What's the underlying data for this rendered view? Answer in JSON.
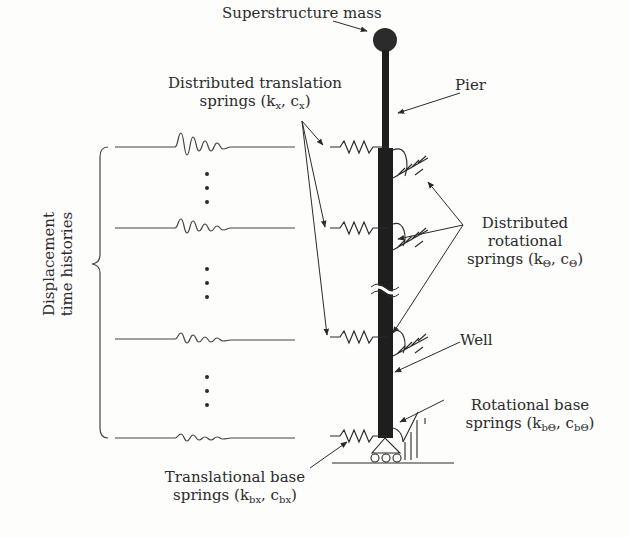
{
  "diagram": {
    "type": "structural model schematic",
    "labels": {
      "superstructure_mass": "Superstructure mass",
      "pier": "Pier",
      "distributed_translation_line1": "Distributed translation",
      "distributed_translation_line2_prefix": "springs (k",
      "distributed_translation_sub_k": "x",
      "distributed_translation_mid": ", c",
      "distributed_translation_sub_c": "x",
      "distributed_translation_suffix": ")",
      "distributed_rotational_line1": "Distributed",
      "distributed_rotational_line2": "rotational",
      "distributed_rotational_line3_prefix": "springs (k",
      "distributed_rotational_sub_k": "Θ",
      "distributed_rotational_mid": ", c",
      "distributed_rotational_sub_c": "Θ",
      "distributed_rotational_suffix": ")",
      "well": "Well",
      "rotational_base_line1": "Rotational base",
      "rotational_base_line2_prefix": "springs (k",
      "rotational_base_sub_k": "bΘ",
      "rotational_base_mid": ", c",
      "rotational_base_sub_c": "bΘ",
      "rotational_base_suffix": ")",
      "translational_base_line1": "Translational base",
      "translational_base_line2_prefix": "springs (k",
      "translational_base_sub_k": "bx",
      "translational_base_mid": ", c",
      "translational_base_sub_c": "bx",
      "translational_base_suffix": ")",
      "displacement_line1": "Displacement",
      "displacement_line2": "time histories"
    },
    "time_history_rows_y": [
      147,
      228,
      337,
      436
    ],
    "spring_rows_y": [
      147,
      228,
      337,
      436
    ],
    "ellipsis_groups": [
      "⋮",
      "⋮",
      "⋮"
    ],
    "colors": {
      "ink": "#2b2b2b",
      "pier_fill": "#1e1e1e",
      "background": "#fdfdfc"
    }
  }
}
